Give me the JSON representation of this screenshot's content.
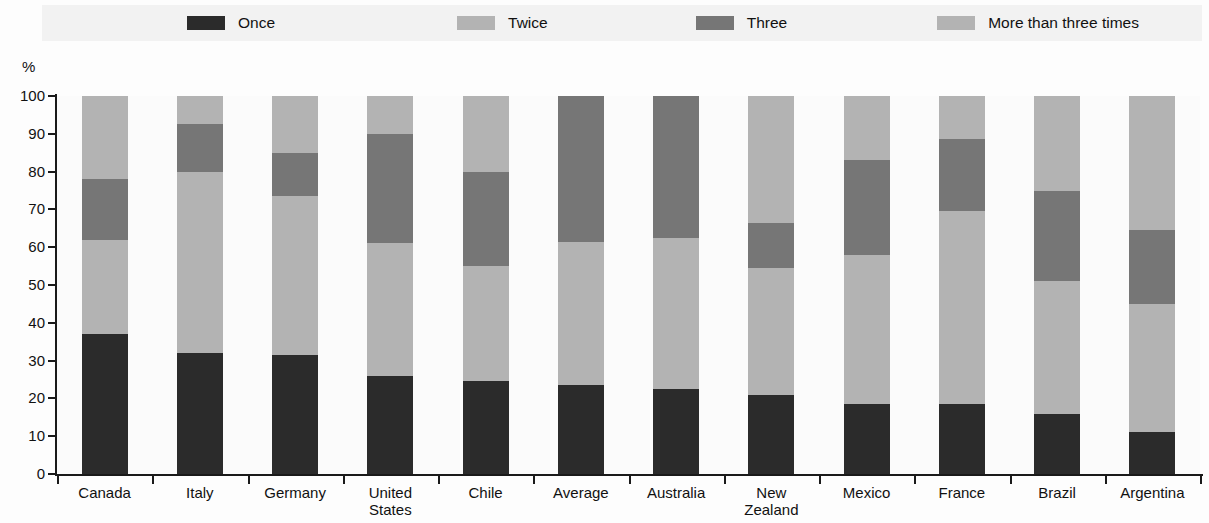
{
  "legend": {
    "items": [
      {
        "label": "Once",
        "color": "#2b2b2b"
      },
      {
        "label": "Twice",
        "color": "#b3b3b3"
      },
      {
        "label": "Three",
        "color": "#767676"
      },
      {
        "label": "More than three times",
        "color": "#b3b3b3"
      }
    ],
    "background": "#f2f2f2"
  },
  "axis": {
    "y_unit_label": "%",
    "y_ticks": [
      "100",
      "90",
      "80",
      "70",
      "60",
      "50",
      "40",
      "30",
      "20",
      "10",
      "0"
    ]
  },
  "chart_data": {
    "type": "bar",
    "stacked": true,
    "title": "",
    "xlabel": "",
    "ylabel": "%",
    "ylim": [
      0,
      100
    ],
    "grid": false,
    "legend_position": "top",
    "categories": [
      "Canada",
      "Italy",
      "Germany",
      "United States",
      "Chile",
      "Average",
      "Australia",
      "New Zealand",
      "Mexico",
      "France",
      "Brazil",
      "Argentina"
    ],
    "category_lines": [
      [
        "Canada"
      ],
      [
        "Italy"
      ],
      [
        "Germany"
      ],
      [
        "United",
        "States"
      ],
      [
        "Chile"
      ],
      [
        "Average"
      ],
      [
        "Australia"
      ],
      [
        "New",
        "Zealand"
      ],
      [
        "Mexico"
      ],
      [
        "France"
      ],
      [
        "Brazil"
      ],
      [
        "Argentina"
      ]
    ],
    "series": [
      {
        "name": "Once",
        "color": "#2b2b2b",
        "values": [
          37.0,
          32.0,
          31.5,
          26.0,
          24.5,
          23.5,
          22.5,
          21.0,
          18.5,
          18.5,
          16.0,
          11.0
        ]
      },
      {
        "name": "Twice",
        "color": "#b3b3b3",
        "values": [
          25.0,
          48.0,
          42.0,
          35.0,
          30.5,
          38.0,
          40.0,
          33.5,
          39.5,
          51.0,
          35.0,
          34.0
        ]
      },
      {
        "name": "Three",
        "color": "#767676",
        "values": [
          16.0,
          12.5,
          11.5,
          29.0,
          25.0,
          38.5,
          37.5,
          12.0,
          25.0,
          19.0,
          24.0,
          19.5
        ]
      },
      {
        "name": "More than three times",
        "color": "#b3b3b3",
        "values": [
          22.0,
          7.5,
          15.0,
          10.0,
          20.0,
          0.0,
          0.0,
          33.5,
          17.0,
          11.5,
          25.0,
          35.5
        ]
      }
    ]
  }
}
